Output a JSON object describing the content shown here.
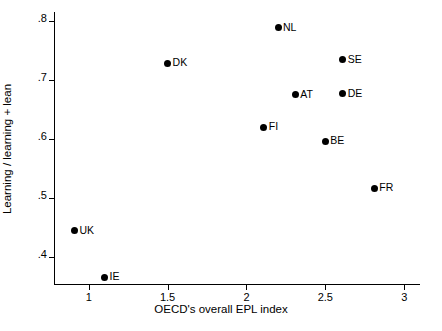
{
  "chart_data": {
    "type": "scatter",
    "title": "",
    "xlabel": "OECD's overall EPL index",
    "ylabel": "Learning / learning + lean",
    "xlim": [
      0.78,
      3.1
    ],
    "ylim": [
      0.355,
      0.815
    ],
    "grid": false,
    "legend": "none",
    "xticks": [
      "1",
      "1.5",
      "2",
      "2.5",
      "3"
    ],
    "xtick_values": [
      1,
      1.5,
      2,
      2.5,
      3
    ],
    "yticks": [
      ".4",
      ".5",
      ".6",
      ".7",
      ".8"
    ],
    "ytick_values": [
      0.4,
      0.5,
      0.6,
      0.7,
      0.8
    ],
    "points": [
      {
        "label": "NL",
        "x": 2.2,
        "y": 0.788
      },
      {
        "label": "SE",
        "x": 2.61,
        "y": 0.734
      },
      {
        "label": "DK",
        "x": 1.5,
        "y": 0.728
      },
      {
        "label": "DE",
        "x": 2.61,
        "y": 0.677
      },
      {
        "label": "AT",
        "x": 2.31,
        "y": 0.675
      },
      {
        "label": "FI",
        "x": 2.11,
        "y": 0.62
      },
      {
        "label": "BE",
        "x": 2.5,
        "y": 0.596
      },
      {
        "label": "FR",
        "x": 2.81,
        "y": 0.517
      },
      {
        "label": "UK",
        "x": 0.91,
        "y": 0.445
      },
      {
        "label": "IE",
        "x": 1.1,
        "y": 0.366
      }
    ]
  }
}
